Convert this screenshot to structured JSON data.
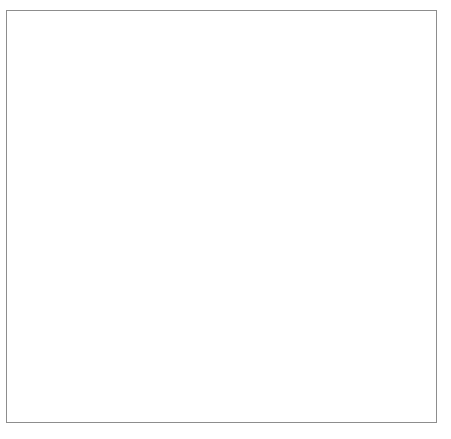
{
  "figure": {
    "border_color": "#8d8d8d",
    "background": "#ffffff"
  },
  "chart_data": {
    "type": "line",
    "title": "",
    "xlabel": "Time (s)",
    "ylabel": "Velocity (m/s)",
    "xlim": [
      0,
      4.4
    ],
    "ylim": [
      0,
      21
    ],
    "x": [
      0,
      1,
      2,
      3,
      4
    ],
    "values": [
      0,
      5,
      10,
      15,
      20
    ],
    "series": [
      {
        "name": "velocity",
        "x": [
          0,
          4
        ],
        "values": [
          0,
          20
        ],
        "linestyle": "dashed",
        "color": "#2b2b2b"
      }
    ],
    "xticks": [
      1,
      2,
      3,
      4
    ],
    "xtick_labels": [
      "1",
      "2",
      "3",
      "4"
    ],
    "yticks": [
      5,
      10,
      15,
      20
    ],
    "ytick_labels": [
      "5",
      "10",
      "15",
      "20"
    ],
    "grid": true,
    "grid_x_step": 0.5,
    "grid_y_step": 2.5,
    "grid_color": "#b9b9b9",
    "axis_color": "#262626",
    "legend": null,
    "annotations": [],
    "slope": 5,
    "slope_units": "m/s^2"
  },
  "axes": {
    "x_axis_name": "Time (s)",
    "y_axis_name": "Velocity (m/s)",
    "x_arrow": "arrow-right",
    "y_arrow": "arrow-up"
  }
}
